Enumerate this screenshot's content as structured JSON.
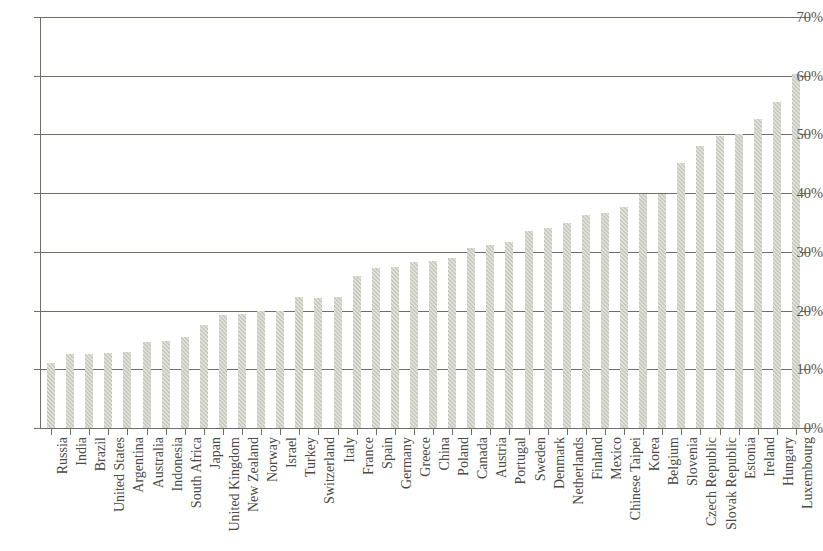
{
  "chart_data": {
    "type": "bar",
    "title": "",
    "xlabel": "",
    "ylabel": "",
    "ylim": [
      0,
      70
    ],
    "ytick_labels": [
      "0%",
      "10%",
      "20%",
      "30%",
      "40%",
      "50%",
      "60%",
      "70%"
    ],
    "ytick_values": [
      0,
      10,
      20,
      30,
      40,
      50,
      60,
      70
    ],
    "grid": "horizontal",
    "legend": "none",
    "bar_color": "#c9c9bd",
    "axis_color": "#6e6e66",
    "categories": [
      "Russia",
      "India",
      "Brazil",
      "United States",
      "Argentina",
      "Australia",
      "Indonesia",
      "South Africa",
      "Japan",
      "United Kingdom",
      "New Zealand",
      "Norway",
      "Israel",
      "Turkey",
      "Switzerland",
      "Italy",
      "France",
      "Spain",
      "Germany",
      "Greece",
      "China",
      "Poland",
      "Canada",
      "Austria",
      "Portugal",
      "Sweden",
      "Denmark",
      "Netherlands",
      "Finland",
      "Mexico",
      "Chinese Taipei",
      "Korea",
      "Belgium",
      "Slovenia",
      "Czech Republic",
      "Slovak Republic",
      "Estonia",
      "Ireland",
      "Hungary",
      "Luxembourg"
    ],
    "values": [
      11.1,
      12.6,
      12.6,
      12.8,
      13.0,
      14.6,
      14.9,
      15.5,
      17.5,
      19.2,
      19.5,
      19.9,
      19.9,
      22.3,
      22.2,
      22.3,
      25.9,
      27.3,
      27.5,
      28.2,
      28.5,
      28.9,
      30.7,
      31.1,
      31.7,
      33.5,
      34.1,
      35.0,
      36.3,
      36.6,
      37.7,
      39.8,
      39.9,
      45.2,
      48.0,
      49.8,
      50.0,
      52.7,
      55.6,
      60.3
    ],
    "value_unit": "%"
  },
  "title_sliver": {
    "text": ""
  }
}
